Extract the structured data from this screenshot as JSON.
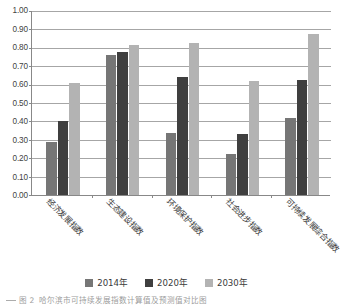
{
  "chart_data": {
    "type": "bar",
    "title": "",
    "xlabel": "",
    "ylabel": "",
    "ylim": [
      0,
      1.0
    ],
    "ytick_step": 0.1,
    "grid": true,
    "legend_position": "bottom",
    "categories": [
      "经济发展指数",
      "生态建设指数",
      "环境保护指数",
      "社会进步指数",
      "可持续发展综合指数"
    ],
    "ytick_labels": [
      "0.00",
      "0.10",
      "0.20",
      "0.30",
      "0.40",
      "0.50",
      "0.60",
      "0.70",
      "0.80",
      "0.90",
      "1.00"
    ],
    "series": [
      {
        "name": "2014年",
        "color": "#767676",
        "values": [
          0.29,
          0.76,
          0.335,
          0.225,
          0.42
        ]
      },
      {
        "name": "2020年",
        "color": "#3f3f3f",
        "values": [
          0.4,
          0.775,
          0.64,
          0.33,
          0.625
        ]
      },
      {
        "name": "2030年",
        "color": "#b3b3b3",
        "values": [
          0.61,
          0.815,
          0.825,
          0.62,
          0.875
        ]
      }
    ]
  },
  "caption": {
    "prefix": "图 2",
    "text": "哈尔滨市可持续发展指数计算值及预测值对比图"
  }
}
